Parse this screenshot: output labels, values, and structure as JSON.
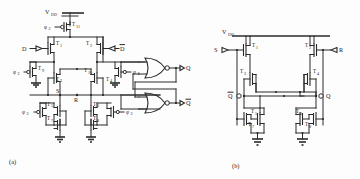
{
  "figure": {
    "caption_a": "(a)",
    "caption_b": "(b)",
    "supply_label": "V",
    "supply_sub": "DD"
  },
  "circuit_a": {
    "power": {
      "label": "V",
      "sub": "DD"
    },
    "inputs": [
      {
        "name": "data-input",
        "label": "D"
      },
      {
        "name": "data-bar-input",
        "label": "D",
        "overbar": true
      },
      {
        "name": "clock-phi2-top",
        "label": "φ",
        "sub": "2"
      },
      {
        "name": "clock-phi2-left-upper",
        "label": "φ",
        "sub": "2"
      },
      {
        "name": "clock-phi2-left-lower",
        "label": "φ",
        "sub": "2"
      },
      {
        "name": "clock-phi2-right-upper",
        "label": "φ",
        "sub": "2"
      },
      {
        "name": "clock-phi2-right-lower",
        "label": "φ",
        "sub": "2"
      }
    ],
    "nodes": [
      {
        "name": "node-s",
        "label": "S"
      },
      {
        "name": "node-r",
        "label": "R"
      }
    ],
    "transistors": [
      {
        "id": "T11",
        "label": "T",
        "sub": "11"
      },
      {
        "id": "T1",
        "label": "T",
        "sub": "1"
      },
      {
        "id": "T2",
        "label": "T",
        "sub": "2"
      },
      {
        "id": "T9",
        "label": "T",
        "sub": "9"
      },
      {
        "id": "T3",
        "label": "T",
        "sub": "3"
      },
      {
        "id": "T10",
        "label": "T",
        "sub": "10"
      },
      {
        "id": "T4",
        "label": "T",
        "sub": "4"
      },
      {
        "id": "T5",
        "label": "T",
        "sub": "5"
      },
      {
        "id": "T7",
        "label": "T",
        "sub": "7"
      },
      {
        "id": "T6",
        "label": "T",
        "sub": "6"
      },
      {
        "id": "T8",
        "label": "T",
        "sub": "8"
      }
    ],
    "outputs": [
      {
        "name": "output-q",
        "label": "Q"
      },
      {
        "name": "output-q-bar",
        "label": "Q",
        "overbar": true
      }
    ],
    "gates": [
      {
        "name": "nor-gate-upper",
        "type": "NOR"
      },
      {
        "name": "nor-gate-lower",
        "type": "NOR"
      }
    ]
  },
  "circuit_b": {
    "power": {
      "label": "V",
      "sub": "DD"
    },
    "inputs": [
      {
        "name": "set-input",
        "label": "S"
      },
      {
        "name": "reset-input",
        "label": "R"
      }
    ],
    "outputs": [
      {
        "name": "output-q-bar",
        "label": "Q",
        "overbar": true
      },
      {
        "name": "output-q",
        "label": "Q"
      }
    ],
    "transistors": [
      {
        "id": "T1",
        "label": "T",
        "sub": "1"
      },
      {
        "id": "T2",
        "label": "T",
        "sub": "2"
      },
      {
        "id": "T3",
        "label": "T",
        "sub": "3"
      },
      {
        "id": "T4",
        "label": "T",
        "sub": "4"
      },
      {
        "id": "T5",
        "label": "T",
        "sub": "5"
      },
      {
        "id": "T6",
        "label": "T",
        "sub": "6"
      },
      {
        "id": "T7",
        "label": "T",
        "sub": "7"
      },
      {
        "id": "T8",
        "label": "T",
        "sub": "8"
      }
    ]
  },
  "colors": {
    "ink": "#2b2b2b",
    "background": "#fdfdfd"
  }
}
